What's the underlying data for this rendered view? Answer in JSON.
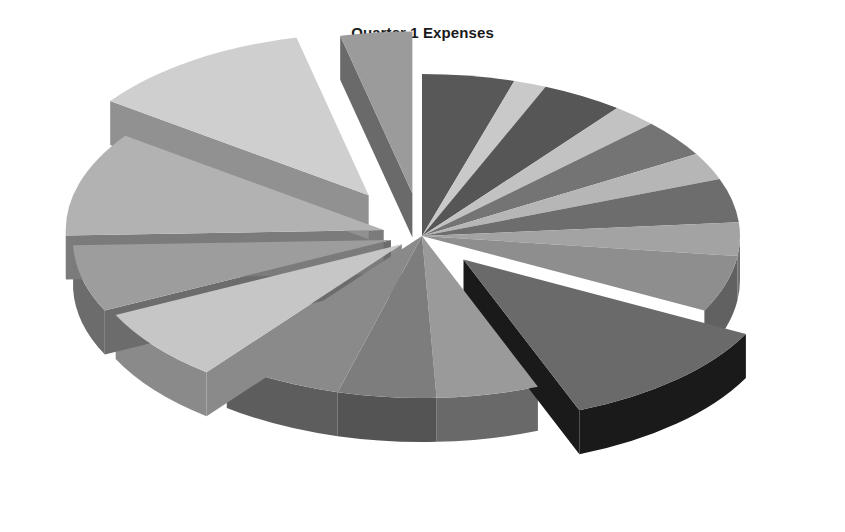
{
  "chart": {
    "title": "Quarter 1 Expenses",
    "background": "#ffffff",
    "title_color": "#1a1a1a"
  },
  "chart_data": {
    "type": "pie",
    "title": "Quarter 1 Expenses",
    "subtitle": "",
    "xlabel": "",
    "ylabel": "",
    "style": "3d-exploded-pie",
    "grid": false,
    "legend": "none",
    "labels_shown": false,
    "center": {
      "x": 422,
      "y": 236
    },
    "radius_x": 318,
    "radius_y": 162,
    "depth": 44,
    "start_angle_deg": -90,
    "direction": "clockwise",
    "categories": [
      "Slice 1",
      "Slice 2",
      "Slice 3",
      "Slice 4",
      "Slice 5",
      "Slice 6",
      "Slice 7",
      "Slice 8",
      "Slice 9",
      "Slice 10",
      "Slice 11",
      "Slice 12",
      "Slice 13",
      "Slice 14",
      "Slice 15",
      "Slice 16",
      "Slice 17",
      "Slice 18"
    ],
    "values": [
      4.5,
      1.6,
      4.0,
      2.2,
      3.6,
      2.6,
      4.2,
      3.2,
      5.4,
      11.0,
      5.0,
      4.8,
      6.0,
      7.0,
      6.4,
      10.0,
      11.0,
      3.5
    ],
    "colors": [
      "#585858",
      "#c9c9c9",
      "#565656",
      "#c2c2c2",
      "#747474",
      "#b6b6b6",
      "#6d6d6d",
      "#a3a3a3",
      "#8e8e8e",
      "#6a6a6a",
      "#9a9a9a",
      "#7d7d7d",
      "#8a8a8a",
      "#c6c6c6",
      "#9d9d9d",
      "#b2b2b2",
      "#cfcfcf",
      "#9b9b9b"
    ],
    "side_colors": [
      "#3a3a3a",
      "#8d8d8d",
      "#393939",
      "#878787",
      "#4e4e4e",
      "#7e7e7e",
      "#494949",
      "#717171",
      "#616161",
      "#1a1a1a",
      "#696969",
      "#545454",
      "#5d5d5d",
      "#8a8a8a",
      "#6c6c6c",
      "#7b7b7b",
      "#919191",
      "#6a6a6a"
    ],
    "exploded": [
      false,
      false,
      false,
      false,
      false,
      false,
      false,
      false,
      false,
      true,
      false,
      false,
      false,
      true,
      true,
      true,
      true,
      true
    ],
    "explode_distance": [
      0,
      0,
      0,
      0,
      0,
      0,
      0,
      0,
      0,
      62,
      0,
      0,
      0,
      26,
      32,
      40,
      96,
      84
    ],
    "units": "percent"
  }
}
